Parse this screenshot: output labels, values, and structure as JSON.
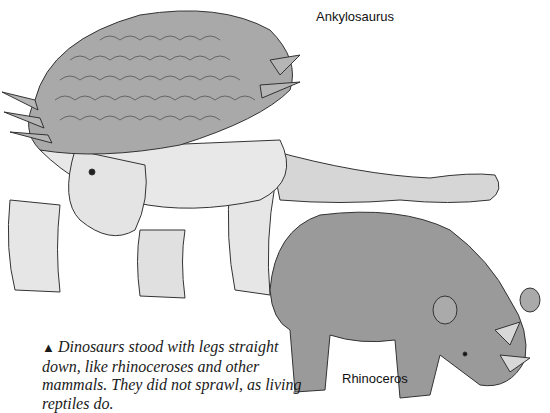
{
  "illustration": {
    "subjects": [
      {
        "name": "Ankylosaurus",
        "label": "Ankylosaurus"
      },
      {
        "name": "Rhinoceros",
        "label": "Rhinoceros"
      }
    ]
  },
  "caption": {
    "marker": "▲",
    "text": "Dinosaurs stood with legs straight down, like rhinoceroses and other mammals. They did not sprawl, as living reptiles do."
  },
  "colors": {
    "background": "#ffffff",
    "armor": "#a9a9a9",
    "body": "#e4e4e4",
    "rhino": "#9a9a9a",
    "ink": "#1a1a1a"
  }
}
